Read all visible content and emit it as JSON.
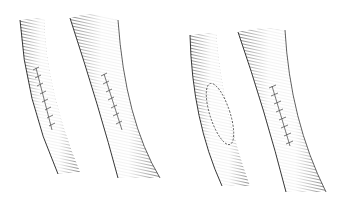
{
  "figure": {
    "type": "illustration",
    "colors": {
      "background": "#ffffff",
      "ink": "#222222",
      "suture": "#555555"
    },
    "vessels": [
      {
        "id": "v1",
        "closure": "linear-suture"
      },
      {
        "id": "v2",
        "closure": "linear-suture"
      },
      {
        "id": "v3",
        "closure": "elliptical-patch"
      },
      {
        "id": "v4",
        "closure": "linear-suture"
      }
    ]
  }
}
